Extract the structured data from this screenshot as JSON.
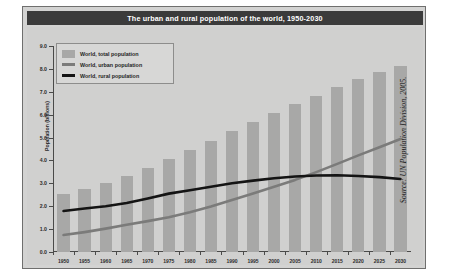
{
  "figure": {
    "title": "The urban and rural population of the world, 1950-2030",
    "source_note": "Source: UN Population Division, 2005.",
    "colors": {
      "title_bar_bg": "#3b3b3b",
      "title_text": "#ffffff",
      "panel_bg": "#d0d0cf",
      "frame_bg": "#d3d3d2",
      "bar_fill": "#a8a8a7",
      "urban_line": "#7b7b7a",
      "rural_line": "#141414",
      "axis": "#4a4a49"
    }
  },
  "legend": {
    "position": "top-left inside plot",
    "entries": [
      {
        "label": "World, total population",
        "marker": "box",
        "color": "#a8a8a7"
      },
      {
        "label": "World, urban population",
        "marker": "line",
        "color": "#7b7b7a"
      },
      {
        "label": "World, rural population",
        "marker": "line",
        "color": "#141414"
      }
    ]
  },
  "chart_data": {
    "type": "bar",
    "title": "The urban and rural population of the world, 1950-2030",
    "subtitle": "",
    "xlabel": "",
    "ylabel": "Population (billions)",
    "xlim": [
      1950,
      2030
    ],
    "ylim": [
      0.0,
      9.0
    ],
    "grid": false,
    "legend_position": "upper left",
    "categories": [
      1950,
      1955,
      1960,
      1965,
      1970,
      1975,
      1980,
      1985,
      1990,
      1995,
      2000,
      2005,
      2010,
      2015,
      2020,
      2025,
      2030
    ],
    "ytick_labels": [
      "0.0",
      "1.0",
      "2.0",
      "3.0",
      "4.0",
      "5.0",
      "6.0",
      "7.0",
      "8.0",
      "9.0"
    ],
    "ytick_values": [
      0.0,
      1.0,
      2.0,
      3.0,
      4.0,
      5.0,
      6.0,
      7.0,
      8.0,
      9.0
    ],
    "xtick_labels": [
      "1950",
      "1955",
      "1960",
      "1965",
      "1970",
      "1975",
      "1980",
      "1985",
      "1990",
      "1995",
      "2000",
      "2005",
      "2010",
      "2015",
      "2020",
      "2025",
      "2030"
    ],
    "series": [
      {
        "name": "World, total population",
        "kind": "bar",
        "color": "#a8a8a7",
        "values": [
          2.52,
          2.77,
          3.02,
          3.33,
          3.69,
          4.07,
          4.44,
          4.84,
          5.27,
          5.68,
          6.07,
          6.45,
          6.83,
          7.2,
          7.54,
          7.85,
          8.13
        ]
      },
      {
        "name": "World, urban population",
        "kind": "line",
        "color": "#7b7b7a",
        "values": [
          0.74,
          0.87,
          1.02,
          1.19,
          1.35,
          1.52,
          1.74,
          1.99,
          2.27,
          2.56,
          2.85,
          3.15,
          3.49,
          3.85,
          4.22,
          4.58,
          4.94
        ]
      },
      {
        "name": "World, rural population",
        "kind": "line",
        "color": "#141414",
        "values": [
          1.79,
          1.9,
          2.0,
          2.14,
          2.34,
          2.55,
          2.7,
          2.85,
          3.0,
          3.12,
          3.22,
          3.3,
          3.34,
          3.35,
          3.32,
          3.27,
          3.19
        ]
      }
    ],
    "annotations": [
      {
        "text": "urban line crosses rural line",
        "x": 2008,
        "y": 3.34
      }
    ]
  }
}
